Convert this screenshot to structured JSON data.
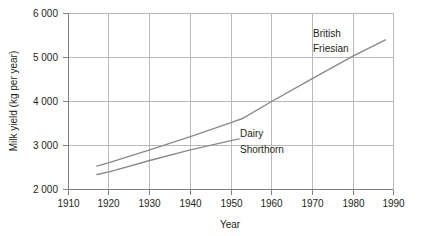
{
  "chart_data": {
    "type": "line",
    "title": "",
    "xlabel": "Year",
    "ylabel": "Milk yield (kg per year)",
    "xlim": [
      1910,
      1990
    ],
    "ylim": [
      2000,
      6000
    ],
    "grid": true,
    "legend_position": "inline-annotations",
    "x_ticks": [
      1910,
      1920,
      1930,
      1940,
      1950,
      1960,
      1970,
      1980,
      1990
    ],
    "x_tick_labels": [
      "1910",
      "1920",
      "1930",
      "1940",
      "1950",
      "1960",
      "1970",
      "1980",
      "1990"
    ],
    "y_ticks": [
      2000,
      3000,
      4000,
      5000,
      6000
    ],
    "y_tick_labels": [
      "2 000",
      "3 000",
      "4 000",
      "5 000",
      "6 000"
    ],
    "line_color": "#8a8a8a",
    "grid_color": "#b9b9b9",
    "axis_color": "#808080",
    "series": [
      {
        "name": "British Friesian",
        "label_line1": "British",
        "label_line2": "Friesian",
        "x": [
          1917,
          1920,
          1930,
          1940,
          1950,
          1953,
          1960,
          1970,
          1980,
          1988
        ],
        "values": [
          2530,
          2610,
          2900,
          3200,
          3520,
          3620,
          4000,
          4520,
          5030,
          5400
        ]
      },
      {
        "name": "Dairy Shorthorn",
        "label_line1": "Dairy",
        "label_line2": "Shorthorn",
        "x": [
          1917,
          1920,
          1930,
          1940,
          1950,
          1952
        ],
        "values": [
          2340,
          2400,
          2660,
          2900,
          3110,
          3150
        ]
      }
    ]
  },
  "axis": {
    "x_title": "Year",
    "y_title": "Milk yield (kg per year)"
  },
  "annotations": {
    "british_friesian_line1": "British",
    "british_friesian_line2": "Friesian",
    "dairy_shorthorn_line1": "Dairy",
    "dairy_shorthorn_line2": "Shorthorn"
  },
  "ticks": {
    "x": [
      "1910",
      "1920",
      "1930",
      "1940",
      "1950",
      "1960",
      "1970",
      "1980",
      "1990"
    ],
    "y": [
      "2 000",
      "3 000",
      "4 000",
      "5 000",
      "6 000"
    ]
  }
}
